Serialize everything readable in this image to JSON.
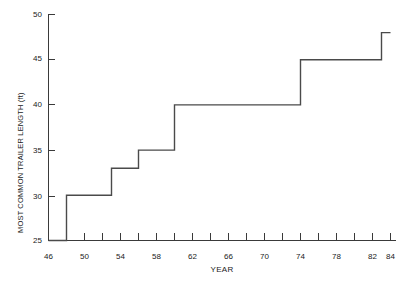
{
  "chart_data": {
    "type": "line",
    "title": "",
    "subtitle": "",
    "xlabel": "YEAR",
    "ylabel": "MOST COMMON TRAILER LENGTH (ft)",
    "xlim": [
      46,
      84
    ],
    "ylim": [
      25,
      50
    ],
    "grid": false,
    "legend": "none",
    "step_style": "post",
    "x_ticks": [
      46,
      48,
      50,
      52,
      54,
      56,
      58,
      60,
      62,
      64,
      66,
      68,
      70,
      72,
      74,
      76,
      78,
      80,
      82,
      84
    ],
    "x_tick_labels": [
      "46",
      "",
      "50",
      "",
      "54",
      "",
      "58",
      "",
      "62",
      "",
      "66",
      "",
      "70",
      "",
      "74",
      "",
      "78",
      "",
      "82",
      "84"
    ],
    "y_ticks": [
      25,
      30,
      35,
      40,
      45,
      50
    ],
    "y_tick_labels": [
      "25",
      "30",
      "35",
      "40",
      "45",
      "50"
    ],
    "x": [
      46,
      48,
      53,
      56,
      60,
      74,
      83,
      84
    ],
    "values": [
      25,
      30,
      33,
      35,
      40,
      45,
      48,
      48
    ],
    "segments": [
      {
        "year_start": 46,
        "year_end": 48,
        "length": 25
      },
      {
        "year_start": 48,
        "year_end": 53,
        "length": 30
      },
      {
        "year_start": 53,
        "year_end": 56,
        "length": 33
      },
      {
        "year_start": 56,
        "year_end": 60,
        "length": 35
      },
      {
        "year_start": 60,
        "year_end": 74,
        "length": 40
      },
      {
        "year_start": 74,
        "year_end": 83,
        "length": 45
      },
      {
        "year_start": 83,
        "year_end": 84,
        "length": 48
      }
    ],
    "colors": {
      "line": "#4a4a4a",
      "axis": "#3a3a3a",
      "text": "#1a1a1a",
      "background": "#ffffff"
    }
  }
}
